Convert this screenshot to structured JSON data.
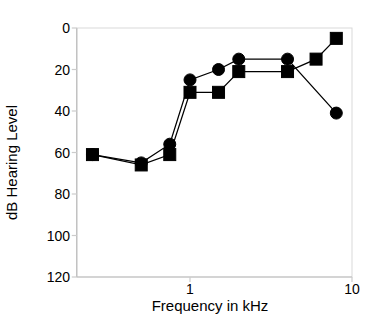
{
  "chart_data": {
    "type": "line",
    "title": "",
    "xlabel": "Frequency in kHz",
    "ylabel": "dB Hearing Level",
    "xscale": "log",
    "xlim": [
      0.2,
      10
    ],
    "ylim": [
      0,
      120
    ],
    "y_inverted": true,
    "grid": false,
    "legend": "none",
    "xticks": [
      {
        "value": 1,
        "label": "1"
      },
      {
        "value": 10,
        "label": "10"
      }
    ],
    "yticks": [
      {
        "value": 0,
        "label": "0"
      },
      {
        "value": 20,
        "label": "20"
      },
      {
        "value": 40,
        "label": "40"
      },
      {
        "value": 60,
        "label": "60"
      },
      {
        "value": 80,
        "label": "80"
      },
      {
        "value": 100,
        "label": "100"
      },
      {
        "value": 120,
        "label": "120"
      }
    ],
    "series": [
      {
        "name": "circle-series",
        "marker": "circle",
        "color": "#000000",
        "x": [
          0.25,
          0.5,
          0.75,
          1.0,
          1.5,
          2.0,
          4.0,
          8.0
        ],
        "y": [
          61,
          65,
          56,
          25,
          20,
          15,
          15,
          41
        ]
      },
      {
        "name": "square-series",
        "marker": "square",
        "color": "#000000",
        "x": [
          0.25,
          0.5,
          0.75,
          1.0,
          1.5,
          2.0,
          4.0,
          6.0,
          8.0
        ],
        "y": [
          61,
          66,
          61,
          31,
          31,
          21,
          21,
          15,
          5
        ]
      }
    ]
  },
  "axes": {
    "frame_color": "#d9d9d9",
    "line_color": "#1a1a1a"
  }
}
